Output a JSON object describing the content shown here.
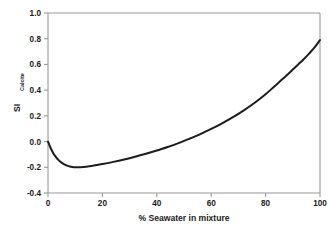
{
  "chart_data": {
    "type": "line",
    "title": "",
    "xlabel": "% Seawater in mixture",
    "ylabel": "SI",
    "ylabel_subscript": "Calcite",
    "xlim": [
      0,
      100
    ],
    "ylim": [
      -0.4,
      1.0
    ],
    "xticks": [
      "0",
      "20",
      "40",
      "60",
      "80",
      "100"
    ],
    "xtick_values": [
      0,
      20,
      40,
      60,
      80,
      100
    ],
    "yticks": [
      "-0.4",
      "-0.2",
      "0.0",
      "0.2",
      "0.4",
      "0.6",
      "0.8",
      "1.0"
    ],
    "ytick_values": [
      -0.4,
      -0.2,
      0.0,
      0.2,
      0.4,
      0.6,
      0.8,
      1.0
    ],
    "grid": false,
    "legend": false,
    "series": [
      {
        "name": "SI Calcite",
        "color": "#1c1c1c",
        "x": [
          0,
          2,
          4,
          6,
          8,
          10,
          12,
          14,
          16,
          18,
          20,
          25,
          30,
          35,
          40,
          45,
          50,
          55,
          60,
          65,
          70,
          75,
          80,
          83,
          86,
          90,
          94,
          97,
          100
        ],
        "values": [
          0.0,
          -0.09,
          -0.145,
          -0.175,
          -0.193,
          -0.199,
          -0.199,
          -0.195,
          -0.189,
          -0.182,
          -0.175,
          -0.155,
          -0.132,
          -0.105,
          -0.073,
          -0.037,
          0.003,
          0.047,
          0.094,
          0.146,
          0.204,
          0.268,
          0.337,
          0.381,
          0.427,
          0.492,
          0.566,
          0.63,
          0.695
        ]
      }
    ],
    "curve_points": [
      [
        0,
        0.0
      ],
      [
        1,
        -0.052
      ],
      [
        2,
        -0.092
      ],
      [
        3,
        -0.122
      ],
      [
        4,
        -0.146
      ],
      [
        5,
        -0.164
      ],
      [
        6,
        -0.178
      ],
      [
        7,
        -0.187
      ],
      [
        8,
        -0.194
      ],
      [
        9,
        -0.198
      ],
      [
        10,
        -0.2
      ],
      [
        11,
        -0.2
      ],
      [
        12,
        -0.199
      ],
      [
        14,
        -0.195
      ],
      [
        16,
        -0.19
      ],
      [
        18,
        -0.183
      ],
      [
        20,
        -0.175
      ],
      [
        24,
        -0.158
      ],
      [
        28,
        -0.139
      ],
      [
        32,
        -0.118
      ],
      [
        36,
        -0.095
      ],
      [
        40,
        -0.07
      ],
      [
        44,
        -0.042
      ],
      [
        48,
        -0.012
      ],
      [
        52,
        0.022
      ],
      [
        56,
        0.058
      ],
      [
        60,
        0.098
      ],
      [
        64,
        0.142
      ],
      [
        68,
        0.19
      ],
      [
        72,
        0.243
      ],
      [
        76,
        0.302
      ],
      [
        80,
        0.368
      ],
      [
        83,
        0.425
      ],
      [
        86,
        0.482
      ],
      [
        88,
        0.52
      ],
      [
        90,
        0.56
      ],
      [
        92,
        0.6
      ],
      [
        94,
        0.64
      ],
      [
        96,
        0.685
      ],
      [
        98,
        0.732
      ],
      [
        100,
        0.79
      ]
    ],
    "annotations": [
      {
        "label": "minimum",
        "x": 11,
        "y": -0.2
      },
      {
        "label": "zero-crossing",
        "x": 49,
        "y": 0.0
      },
      {
        "label": "endpoint",
        "x": 100,
        "y": 0.79
      }
    ]
  },
  "colors": {
    "background": "#ffffff",
    "axis": "#9a9a9a",
    "curve": "#1c1c1c",
    "text": "#1a1a1a"
  }
}
